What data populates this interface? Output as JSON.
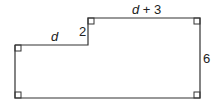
{
  "diagram": {
    "type": "composite-rectilinear-figure",
    "labels": {
      "left_top_side": "d",
      "step_height": "2",
      "top_side": "d + 3",
      "right_side": "6"
    },
    "right_angle_markers": 6,
    "stroke_color": "#333333"
  }
}
